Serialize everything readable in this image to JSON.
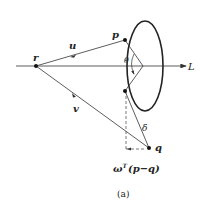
{
  "diagram": {
    "labels": {
      "r": "r",
      "p": "p",
      "q": "q",
      "u": "u",
      "v": "v",
      "L": "L",
      "theta": "θ",
      "delta": "δ",
      "projection": "ω",
      "projection_sup": "T",
      "projection_rest": "(p−q)"
    },
    "caption": "(a)",
    "colors": {
      "stroke": "#333333",
      "dashed": "#555555"
    }
  }
}
